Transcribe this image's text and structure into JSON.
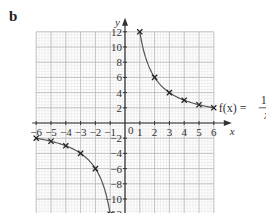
{
  "panel_label": "b",
  "chart_data": {
    "type": "line",
    "title": "",
    "function_label": "f(x) = 12/x",
    "function_label_parts": {
      "lhs": "f(x) =",
      "numerator": "12",
      "denominator": "x"
    },
    "xlabel": "x",
    "ylabel": "y",
    "xlim": [
      -6,
      6
    ],
    "ylim": [
      -12,
      12
    ],
    "x_ticks": [
      -6,
      -5,
      -4,
      -3,
      -2,
      -1,
      0,
      1,
      2,
      3,
      4,
      5,
      6
    ],
    "x_tick_labels": [
      "−6",
      "−5",
      "−4",
      "−3",
      "−2",
      "−1",
      "0",
      "1",
      "2",
      "3",
      "4",
      "5",
      "6"
    ],
    "y_ticks": [
      12,
      10,
      8,
      6,
      4,
      2,
      -2,
      -4,
      -6,
      -8,
      -10,
      -12
    ],
    "y_tick_labels": [
      "12",
      "10",
      "8",
      "6",
      "4",
      "2",
      "−2",
      "−4",
      "−6",
      "−8",
      "−10",
      "−12"
    ],
    "grid": true,
    "series": [
      {
        "name": "positive branch",
        "x": [
          1,
          2,
          3,
          4,
          5,
          6
        ],
        "y": [
          12,
          6,
          4,
          3,
          2.4,
          2
        ],
        "markers": "x"
      },
      {
        "name": "negative branch",
        "x": [
          -6,
          -5,
          -4,
          -3,
          -2,
          -1
        ],
        "y": [
          -2,
          -2.4,
          -3,
          -4,
          -6,
          -12
        ],
        "markers": "x"
      }
    ],
    "colors": {
      "grid_major": "#b8b8b8",
      "grid_minor": "#e2e2e2",
      "curve": "#555555",
      "axis": "#333333"
    }
  }
}
